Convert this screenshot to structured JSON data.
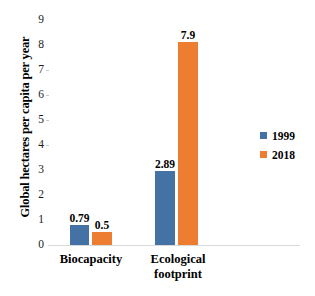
{
  "chart_data": {
    "type": "bar",
    "title": "",
    "xlabel": "",
    "ylabel": "Global hectares per capita per year",
    "categories": [
      "Biocapacity",
      "Ecological footprint"
    ],
    "series": [
      {
        "name": "1999",
        "color": "#4472a4",
        "values": [
          0.79,
          2.89
        ],
        "labels": [
          "0.79",
          "2.89"
        ]
      },
      {
        "name": "2018",
        "color": "#ed7d31",
        "values": [
          0.5,
          7.9
        ],
        "labels": [
          "0.5",
          "7.9"
        ]
      }
    ],
    "ylim": [
      0,
      9
    ],
    "yticks": [
      0,
      1,
      2,
      3,
      4,
      5,
      6,
      7,
      8,
      9
    ],
    "ytick_labels": [
      "0",
      "1",
      "2",
      "3",
      "4",
      "5",
      "6",
      "7",
      "8",
      "9"
    ],
    "grid": false,
    "legend_position": "right"
  },
  "axis": {
    "y_title": "Global hectares per capita per year",
    "ticks": {
      "t9": "9",
      "t8": "8",
      "t7": "7",
      "t6": "6",
      "t5": "5",
      "t4": "4",
      "t3": "3",
      "t2": "2",
      "t1": "1",
      "t0": "0"
    }
  },
  "categories": {
    "c0": "Biocapacity",
    "c1_line1": "Ecological",
    "c1_line2": "footprint"
  },
  "values": {
    "biocapacity_1999": "0.79",
    "biocapacity_2018": "0.5",
    "footprint_1999": "2.89",
    "footprint_2018": "7.9"
  },
  "legend": {
    "series1": "1999",
    "series2": "2018"
  },
  "colors": {
    "series1": "#4472a4",
    "series2": "#ed7d31",
    "axis_line": "#d9d9d9",
    "background": "#ffffff"
  }
}
